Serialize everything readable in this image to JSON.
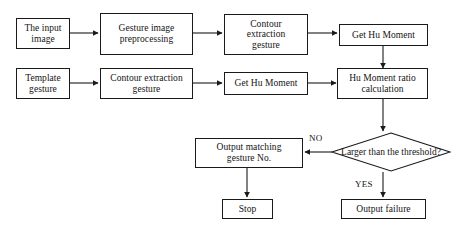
{
  "diagram": {
    "type": "flowchart",
    "colors": {
      "background": "#ffffff",
      "stroke": "#1a1a1a",
      "text": "#141414",
      "node_fill": "#ffffff"
    },
    "nodes": [
      {
        "id": "input_image",
        "shape": "rect",
        "label": "The input image",
        "line1": "The input",
        "line2": "image"
      },
      {
        "id": "preprocessing",
        "shape": "rect",
        "label": "Gesture image preprocessing",
        "line1": "Gesture image",
        "line2": "preprocessing"
      },
      {
        "id": "contour_top",
        "shape": "rect",
        "label": "Contour extraction gesture",
        "line1": "Contour",
        "line2": "extraction",
        "line3": "gesture"
      },
      {
        "id": "hu_moment_top",
        "shape": "rect",
        "label": "Get Hu Moment",
        "line1": "Get Hu Moment"
      },
      {
        "id": "template_gesture",
        "shape": "rect",
        "label": "Template gesture",
        "line1": "Template",
        "line2": "gesture"
      },
      {
        "id": "contour_bottom",
        "shape": "rect",
        "label": "Contour extraction gesture",
        "line1": "Contour extraction",
        "line2": "gesture"
      },
      {
        "id": "hu_moment_bottom",
        "shape": "rect",
        "label": "Get Hu Moment",
        "line1": "Get Hu Moment"
      },
      {
        "id": "ratio_calc",
        "shape": "rect",
        "label": "Hu Moment ratio calculation",
        "line1": "Hu Moment ratio",
        "line2": "calculation"
      },
      {
        "id": "threshold_check",
        "shape": "diamond",
        "label": "Larger than the threshold?",
        "line1": "Larger than the",
        "line2": "threshold?"
      },
      {
        "id": "output_matching",
        "shape": "rect",
        "label": "Output matching gesture No.",
        "line1": "Output matching",
        "line2": "gesture No."
      },
      {
        "id": "stop",
        "shape": "rect",
        "label": "Stop",
        "line1": "Stop"
      },
      {
        "id": "output_failure",
        "shape": "rect",
        "label": "Output failure",
        "line1": "Output failure"
      }
    ],
    "edges": [
      {
        "from": "input_image",
        "to": "preprocessing",
        "label": ""
      },
      {
        "from": "preprocessing",
        "to": "contour_top",
        "label": ""
      },
      {
        "from": "contour_top",
        "to": "hu_moment_top",
        "label": ""
      },
      {
        "from": "hu_moment_top",
        "to": "ratio_calc",
        "label": ""
      },
      {
        "from": "template_gesture",
        "to": "contour_bottom",
        "label": ""
      },
      {
        "from": "contour_bottom",
        "to": "hu_moment_bottom",
        "label": ""
      },
      {
        "from": "hu_moment_bottom",
        "to": "ratio_calc",
        "label": ""
      },
      {
        "from": "ratio_calc",
        "to": "threshold_check",
        "label": ""
      },
      {
        "from": "threshold_check",
        "to": "output_matching",
        "label": "NO"
      },
      {
        "from": "threshold_check",
        "to": "output_failure",
        "label": "YES"
      },
      {
        "from": "output_matching",
        "to": "stop",
        "label": ""
      }
    ],
    "edge_labels": {
      "no": "NO",
      "yes": "YES"
    }
  }
}
